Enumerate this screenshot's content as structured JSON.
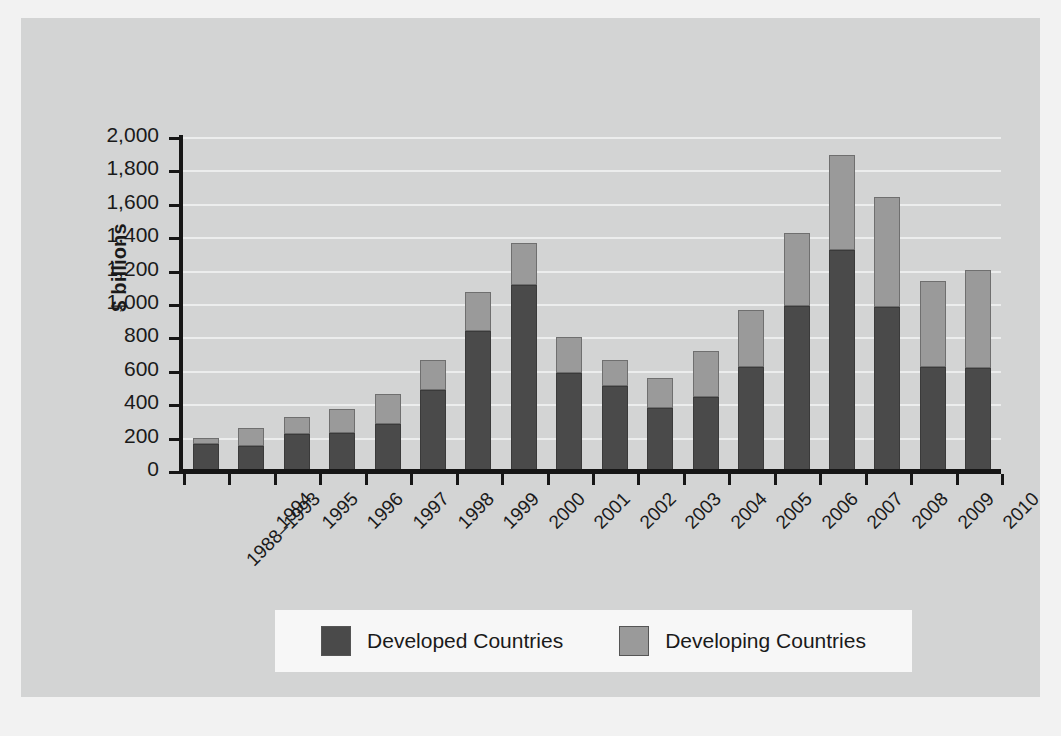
{
  "chart_data": {
    "type": "bar",
    "stacked": true,
    "title": "",
    "xlabel": "",
    "ylabel": "$ billions",
    "ylim": [
      0,
      2000
    ],
    "ytick_labels": [
      "2,000",
      "1,800",
      "1,600",
      "1,400",
      "1,200",
      "1,000",
      "800",
      "600",
      "400",
      "200",
      "0"
    ],
    "ytick_values": [
      2000,
      1800,
      1600,
      1400,
      1200,
      1000,
      800,
      600,
      400,
      200,
      0
    ],
    "grid": true,
    "legend_position": "bottom",
    "categories": [
      "1988–1993",
      "1994",
      "1995",
      "1996",
      "1997",
      "1998",
      "1999",
      "2000",
      "2001",
      "2002",
      "2003",
      "2004",
      "2005",
      "2006",
      "2007",
      "2008",
      "2009",
      "2010"
    ],
    "series": [
      {
        "name": "Developed Countries",
        "color": "#4a4a4a",
        "values": [
          160,
          150,
          220,
          230,
          280,
          485,
          840,
          1115,
          585,
          510,
          380,
          445,
          625,
          990,
          1325,
          985,
          625,
          615
        ]
      },
      {
        "name": "Developing Countries",
        "color": "#9a9a9a",
        "values": [
          40,
          110,
          105,
          140,
          180,
          180,
          230,
          250,
          215,
          155,
          175,
          275,
          340,
          435,
          565,
          655,
          515,
          590
        ]
      }
    ],
    "totals": [
      200,
      260,
      325,
      370,
      460,
      665,
      1070,
      1365,
      800,
      665,
      555,
      720,
      965,
      1425,
      1890,
      1640,
      1140,
      1205
    ]
  },
  "legend": {
    "items": [
      {
        "label": "Developed Countries",
        "color": "#4a4a4a"
      },
      {
        "label": "Developing Countries",
        "color": "#9a9a9a"
      }
    ]
  }
}
